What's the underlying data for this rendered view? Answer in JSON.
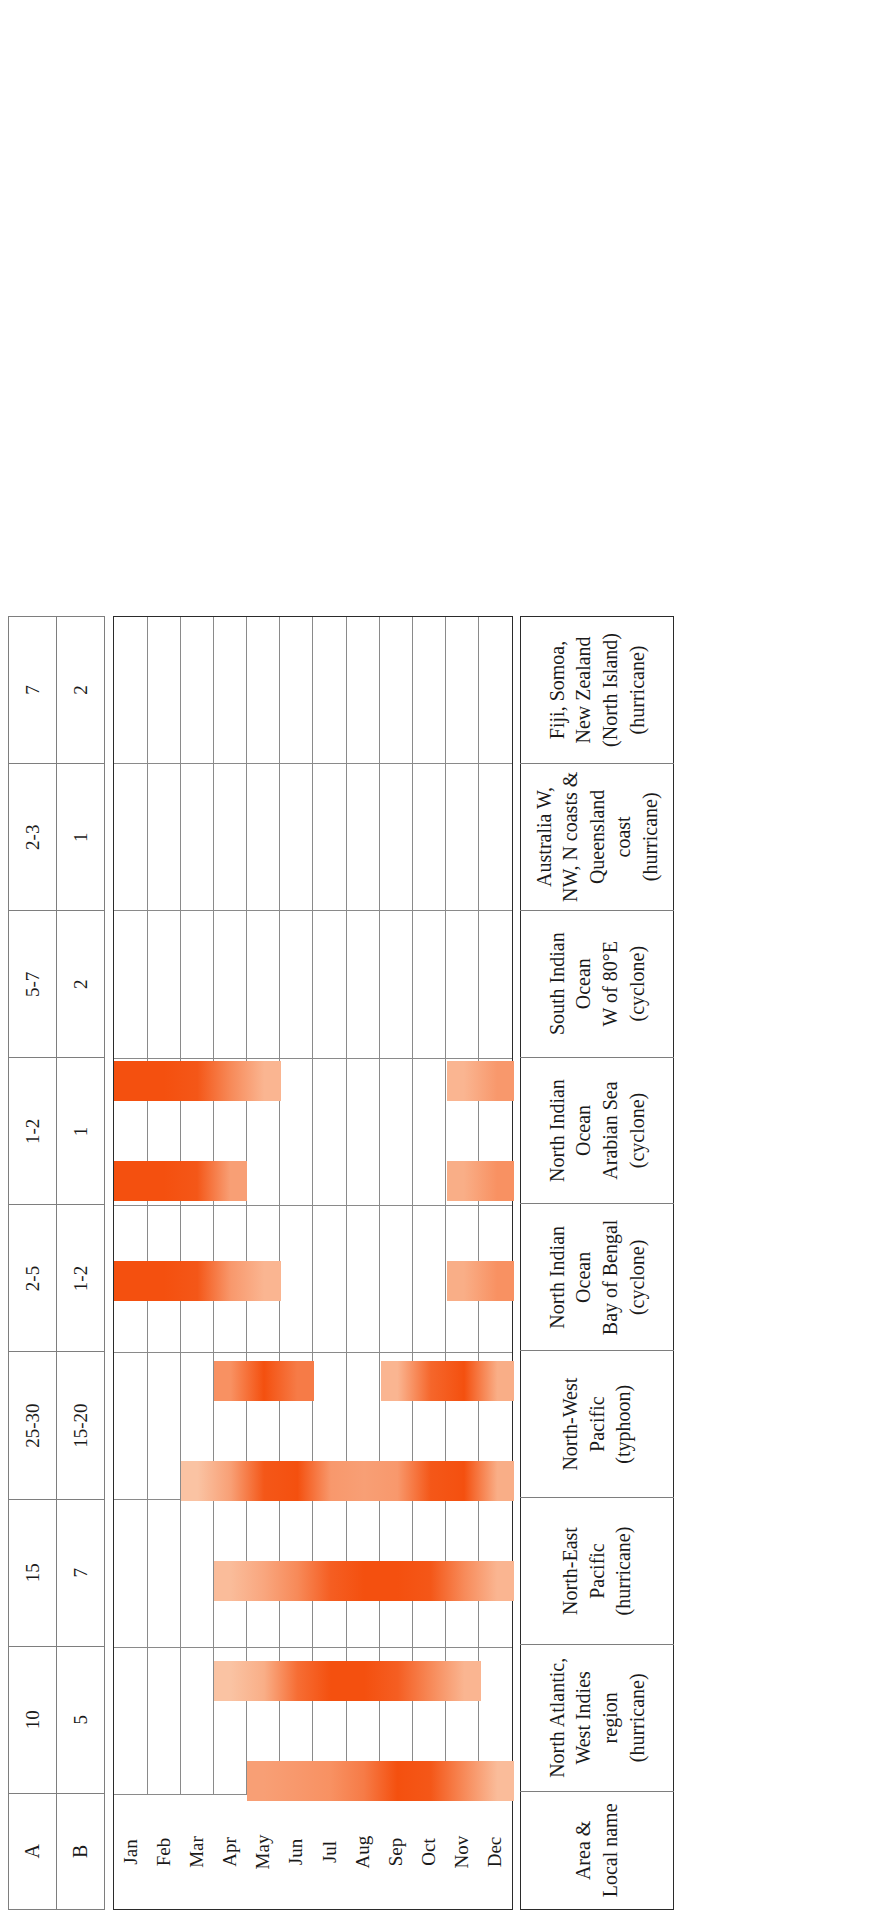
{
  "table": {
    "row_header_a": "A",
    "row_header_b": "B",
    "name_header": "Area & Local name",
    "months": [
      "Dec",
      "Nov",
      "Oct",
      "Sep",
      "Aug",
      "Jul",
      "Jun",
      "May",
      "Apr",
      "Mar",
      "Feb",
      "Jan"
    ],
    "accent_color": "#F4500F",
    "regions": [
      {
        "name_line1": "North Atlantic, West Indies",
        "name_line2": "region (hurricane)",
        "a": "10",
        "b": "5"
      },
      {
        "name_line1": "North-East Pacific (hurricane)",
        "name_line2": "",
        "a": "15",
        "b": "7"
      },
      {
        "name_line1": "North-West Pacific (typhoon)",
        "name_line2": "",
        "a": "25-30",
        "b": "15-20"
      },
      {
        "name_line1": "North Indian Ocean",
        "name_line2": "Bay of Bengal (cyclone)",
        "a": "2-5",
        "b": "1-2"
      },
      {
        "name_line1": "North Indian Ocean",
        "name_line2": "Arabian Sea (cyclone)",
        "a": "1-2",
        "b": "1"
      },
      {
        "name_line1": "South Indian Ocean",
        "name_line2": "W of 80°E (cyclone)",
        "a": "5-7",
        "b": "2"
      },
      {
        "name_line1": "Australia W, NW, N coasts &",
        "name_line2": "Queensland coast (hurricane)",
        "a": "2-3",
        "b": "1"
      },
      {
        "name_line1": "Fiji, Somoa, New Zealand",
        "name_line2": "(North Island) (hurricane)",
        "a": "7",
        "b": "2"
      }
    ]
  },
  "chart_data": {
    "type": "heatmap",
    "xlabel": "Area & Local name",
    "ylabel": "Month",
    "categories": [
      "Dec",
      "Nov",
      "Oct",
      "Sep",
      "Aug",
      "Jul",
      "Jun",
      "May",
      "Apr",
      "Mar",
      "Feb",
      "Jan"
    ],
    "legend": [
      "A = average number of tropical storms per year",
      "B = average number reaching hurricane force"
    ],
    "grid": true,
    "series": [
      {
        "name": "North Atlantic, West Indies region (hurricane)",
        "a": 10,
        "b": 5,
        "season_start_month": "May",
        "season_end_month": "Dec",
        "intensity_by_month": {
          "Jan": 0,
          "Feb": 0,
          "Mar": 0,
          "Apr": 0,
          "May": 0.45,
          "Jun": 0.5,
          "Jul": 0.55,
          "Aug": 0.7,
          "Sep": 1.0,
          "Oct": 0.95,
          "Nov": 0.6,
          "Dec": 0.25
        }
      },
      {
        "name": "North-East Pacific (hurricane)",
        "a": 15,
        "b": 7,
        "season_start_month": "Apr",
        "season_end_month": "Nov",
        "intensity_by_month": {
          "Jan": 0,
          "Feb": 0,
          "Mar": 0,
          "Apr": 0.2,
          "May": 0.35,
          "Jun": 0.8,
          "Jul": 1.0,
          "Aug": 1.0,
          "Sep": 0.9,
          "Oct": 0.6,
          "Nov": 0.3,
          "Dec": 0
        }
      },
      {
        "name": "North-West Pacific (typhoon)",
        "a": "25-30",
        "b": "15-20",
        "season_start_month": "Apr",
        "season_end_month": "Dec",
        "intensity_by_month": {
          "Jan": 0,
          "Feb": 0,
          "Mar": 0,
          "Apr": 0.25,
          "May": 0.4,
          "Jun": 0.6,
          "Jul": 0.9,
          "Aug": 1.0,
          "Sep": 1.0,
          "Oct": 0.95,
          "Nov": 0.6,
          "Dec": 0.3
        }
      },
      {
        "name": "North Indian Ocean — Bay of Bengal (cyclone)",
        "a": "2-5",
        "b": "1-2",
        "season_start_month": "Mar",
        "season_end_month": "Dec",
        "intensity_by_month": {
          "Jan": 0,
          "Feb": 0,
          "Mar": 0.2,
          "Apr": 0.45,
          "May": 0.95,
          "Jun": 1.0,
          "Jul": 0.5,
          "Aug": 0.45,
          "Sep": 0.5,
          "Oct": 0.95,
          "Nov": 1.0,
          "Dec": 0.35
        }
      },
      {
        "name": "North Indian Ocean — Arabian Sea (cyclone)",
        "a": "1-2",
        "b": "1",
        "season_start_month": "Apr",
        "season_end_month": "Dec",
        "intensity_by_month": {
          "Jan": 0,
          "Feb": 0,
          "Mar": 0,
          "Apr": 0.55,
          "May": 1.0,
          "Jun": 0.7,
          "Jul": 0,
          "Aug": 0,
          "Sep": 0.3,
          "Oct": 0.85,
          "Nov": 1.0,
          "Dec": 0.35
        }
      },
      {
        "name": "South Indian Ocean — W of 80°E (cyclone)",
        "a": "5-7",
        "b": "2",
        "season_start_month": "Jan",
        "season_end_month": "May",
        "intensity_by_month": {
          "Jan": 1.0,
          "Feb": 1.0,
          "Mar": 0.95,
          "Apr": 0.5,
          "May": 0.3,
          "Jun": 0,
          "Jul": 0,
          "Aug": 0,
          "Sep": 0,
          "Oct": 0,
          "Nov": 0.35,
          "Dec": 0.55
        }
      },
      {
        "name": "Australia W, NW, N coasts & Queensland coast (hurricane)",
        "a": "2-3",
        "b": "1",
        "season_start_month": "Jan",
        "season_end_month": "Apr",
        "intensity_by_month": {
          "Jan": 1.0,
          "Feb": 1.0,
          "Mar": 0.95,
          "Apr": 0.45,
          "May": 0,
          "Jun": 0,
          "Jul": 0,
          "Aug": 0,
          "Sep": 0,
          "Oct": 0,
          "Nov": 0.35,
          "Dec": 0.55
        }
      },
      {
        "name": "Fiji, Somoa, New Zealand (North Island) (hurricane)",
        "a": "7",
        "b": "2",
        "season_start_month": "Jan",
        "season_end_month": "May",
        "intensity_by_month": {
          "Jan": 1.0,
          "Feb": 1.0,
          "Mar": 0.95,
          "Apr": 0.6,
          "May": 0.3,
          "Jun": 0,
          "Jul": 0,
          "Aug": 0,
          "Sep": 0,
          "Oct": 0,
          "Nov": 0.3,
          "Dec": 0.5
        }
      }
    ]
  }
}
